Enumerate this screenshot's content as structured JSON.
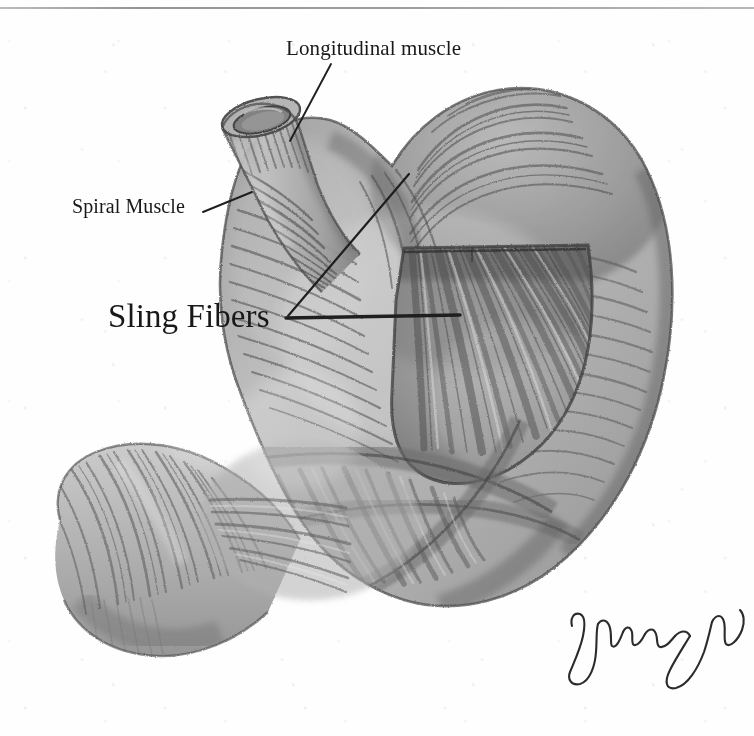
{
  "page": {
    "background_color": "#fefefe",
    "ink_color": "#181818",
    "width": 754,
    "height": 736,
    "has_top_rule": true,
    "top_rule_color": "#9a9a9a",
    "medium": "graphite pencil drawing"
  },
  "figure": {
    "title": "Sling Fibers",
    "regions": [
      "esophagus",
      "cardia",
      "fundus",
      "body",
      "greater curvature",
      "lesser curvature",
      "antrum",
      "pylorus",
      "duodenum"
    ]
  },
  "labels": [
    {
      "id": "longitudinal-muscle",
      "text": "Longitudinal muscle",
      "font_size_px": 21,
      "x": 286,
      "y": 36,
      "leader": {
        "x1": 331,
        "y1": 64,
        "x2": 290,
        "y2": 141
      }
    },
    {
      "id": "spiral-muscle",
      "text": "Spiral Muscle",
      "font_size_px": 20,
      "x": 72,
      "y": 195,
      "leader": {
        "x1": 203,
        "y1": 212,
        "x2": 252,
        "y2": 192
      }
    },
    {
      "id": "sling-fibers",
      "text": "Sling Fibers",
      "font_size_px": 33,
      "x": 108,
      "y": 298,
      "leaders": [
        {
          "x1": 286,
          "y1": 318,
          "x2": 460,
          "y2": 315
        },
        {
          "x1": 286,
          "y1": 318,
          "x2": 409,
          "y2": 174
        }
      ]
    }
  ],
  "signature": {
    "present": true,
    "legible": false,
    "note": "cursive artist signature, lower right"
  }
}
